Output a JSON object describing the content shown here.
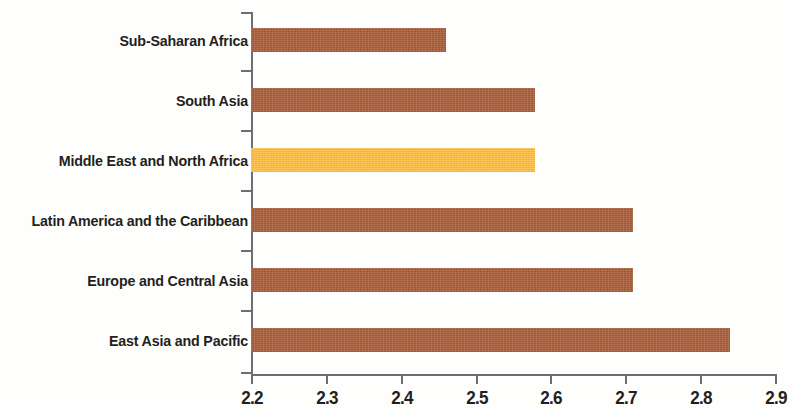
{
  "chart_data": {
    "type": "bar",
    "orientation": "horizontal",
    "title": "",
    "subtitle": "",
    "xlabel": "",
    "ylabel": "",
    "xlim": [
      2.2,
      2.9
    ],
    "xticks": [
      "2.2",
      "2.3",
      "2.4",
      "2.5",
      "2.6",
      "2.7",
      "2.8",
      "2.9"
    ],
    "xtick_values": [
      2.2,
      2.3,
      2.4,
      2.5,
      2.6,
      2.7,
      2.8,
      2.9
    ],
    "grid": false,
    "legend": "none",
    "categories": [
      "Sub-Saharan Africa",
      "South Asia",
      "Middle East and North Africa",
      "Latin America and the Caribbean",
      "Europe and Central Asia",
      "East Asia and Pacific"
    ],
    "values": [
      2.46,
      2.58,
      2.58,
      2.71,
      2.71,
      2.84
    ],
    "bar_colors": [
      "#a8603f",
      "#a8603f",
      "#fbbf4a",
      "#a8603f",
      "#a8603f",
      "#a8603f"
    ],
    "highlight_index": 2,
    "colors": {
      "bar": "#a8603f",
      "highlight": "#fbbf4a",
      "axis": "#6d6e70",
      "text": "#231f20",
      "background": "#fefefd"
    }
  }
}
